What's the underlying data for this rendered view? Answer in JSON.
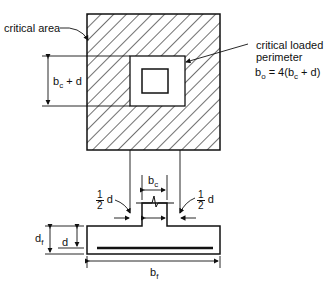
{
  "labels": {
    "critical_area": "critical area",
    "critical_loaded": "critical loaded",
    "perimeter": "perimeter",
    "bo_b": "b",
    "bo_sub": "o",
    "bo_eq": "= 4(b",
    "bo_c": "c",
    "bo_end": "+ d)",
    "bcd_b": "b",
    "bcd_sub": "c",
    "bcd_rest": "+ d",
    "bc_b": "b",
    "bc_sub": "c",
    "half_num": "1",
    "half_den": "2",
    "half_d": "d",
    "df_d": "d",
    "df_sub": "f",
    "d": "d",
    "bf_b": "b",
    "bf_sub": "f"
  },
  "colors": {
    "line": "#111111",
    "background": "#ffffff"
  }
}
